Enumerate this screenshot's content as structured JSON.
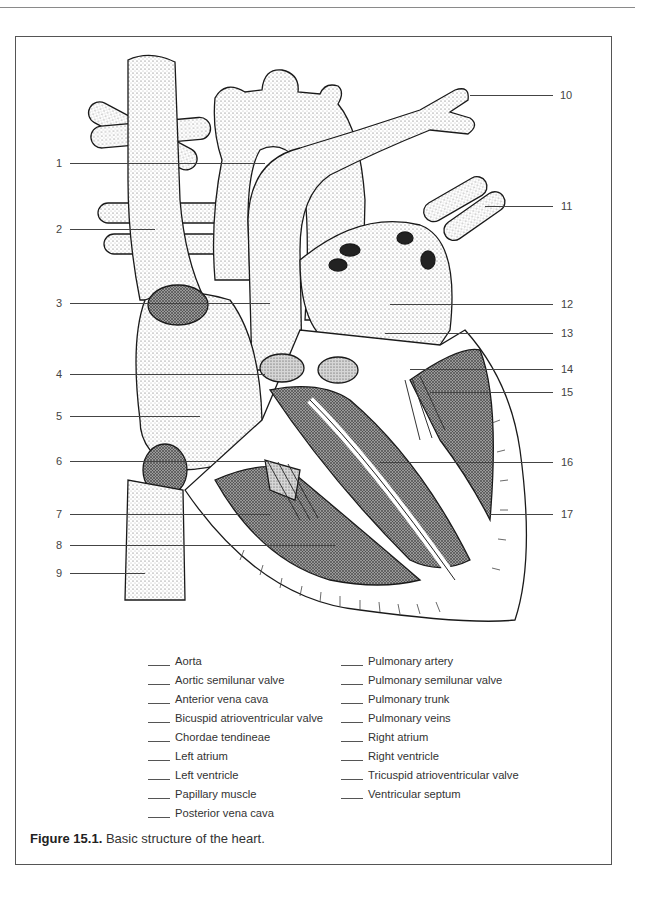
{
  "page": {
    "header_rule": true
  },
  "figure": {
    "number_label": "Figure 15.1.",
    "caption": "Basic structure of the heart."
  },
  "callouts": {
    "left": [
      {
        "number": "1",
        "y": 163
      },
      {
        "number": "2",
        "y": 229
      },
      {
        "number": "3",
        "y": 303
      },
      {
        "number": "4",
        "y": 374
      },
      {
        "number": "5",
        "y": 416
      },
      {
        "number": "6",
        "y": 461
      },
      {
        "number": "7",
        "y": 514
      },
      {
        "number": "8",
        "y": 545
      },
      {
        "number": "9",
        "y": 573
      }
    ],
    "right": [
      {
        "number": "10",
        "y": 95
      },
      {
        "number": "11",
        "y": 206
      },
      {
        "number": "12",
        "y": 304
      },
      {
        "number": "13",
        "y": 333
      },
      {
        "number": "14",
        "y": 369
      },
      {
        "number": "15",
        "y": 392
      },
      {
        "number": "16",
        "y": 462
      },
      {
        "number": "17",
        "y": 514
      }
    ]
  },
  "legend": {
    "left_column": [
      "Aorta",
      "Aortic semilunar valve",
      "Anterior vena cava",
      "Bicuspid atrioventricular valve",
      "Chordae tendineae",
      "Left atrium",
      "Left ventricle",
      "Papillary muscle",
      "Posterior vena cava"
    ],
    "right_column": [
      "Pulmonary artery",
      "Pulmonary semilunar valve",
      "Pulmonary trunk",
      "Pulmonary veins",
      "Right atrium",
      "Right ventricle",
      "Tricuspid atrioventricular valve",
      "Ventricular septum"
    ]
  },
  "diagram": {
    "style": "stippled-line-drawing"
  }
}
